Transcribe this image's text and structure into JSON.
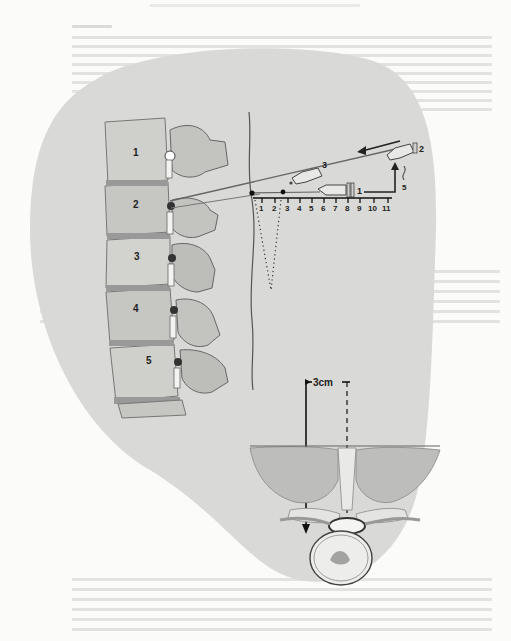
{
  "figure": {
    "type": "anatomical illustration",
    "vertebra_labels": [
      "1",
      "2",
      "3",
      "4",
      "5"
    ],
    "scale_ticks": [
      "1",
      "2",
      "3",
      "4",
      "5",
      "6",
      "7",
      "8",
      "9",
      "10",
      "11"
    ],
    "syringe_labels": {
      "first": "1",
      "second": "2",
      "third": "3"
    },
    "depth_label": "3cm",
    "step_label": "5",
    "colors": {
      "page": "#fbfbfa",
      "backdrop": "#d9d9d7",
      "bone": "#c9c9c6",
      "ink": "#222222"
    }
  }
}
